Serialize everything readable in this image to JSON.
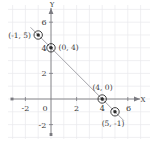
{
  "figure": {
    "title": "",
    "axis_labels": {
      "x": "X",
      "y": "Y"
    },
    "origin_label": "0",
    "colors": {
      "grid": "#e9e9ec",
      "axis": "#7a7a80",
      "line": "#9a9aa0",
      "marker": "#2b2b2b",
      "text": "#3a3a3a",
      "background": "#ffffff"
    },
    "x_ticks": [
      {
        "value": -2,
        "label": "-2"
      },
      {
        "value": 2,
        "label": "2"
      },
      {
        "value": 4,
        "label": "4"
      },
      {
        "value": 6,
        "label": "6"
      }
    ],
    "y_ticks": [
      {
        "value": -2,
        "label": "-2"
      },
      {
        "value": 2,
        "label": "2"
      },
      {
        "value": 4,
        "label": "4"
      },
      {
        "value": 6,
        "label": "6"
      }
    ],
    "points": [
      {
        "id": "p1",
        "x": -1,
        "y": 5,
        "label": "(-1, 5)",
        "label_side": "left"
      },
      {
        "id": "p2",
        "x": 0,
        "y": 4,
        "label": "(0, 4)",
        "label_side": "right"
      },
      {
        "id": "p3",
        "x": 4,
        "y": 0,
        "label": "(4, 0)",
        "label_side": "above"
      },
      {
        "id": "p4",
        "x": 5,
        "y": -1,
        "label": "(5, -1)",
        "label_side": "below"
      }
    ]
  },
  "chart_data": {
    "type": "scatter",
    "title": "",
    "xlabel": "X",
    "ylabel": "Y",
    "xlim": [
      -3,
      7
    ],
    "ylim": [
      -3,
      7
    ],
    "grid": true,
    "legend": "none",
    "series": [
      {
        "name": "line x + y = 4",
        "type": "line",
        "x": [
          -1.6,
          5.7
        ],
        "y": [
          5.6,
          -1.7
        ]
      },
      {
        "name": "plotted points",
        "type": "scatter",
        "points": [
          {
            "x": -1,
            "y": 5
          },
          {
            "x": 0,
            "y": 4
          },
          {
            "x": 4,
            "y": 0
          },
          {
            "x": 5,
            "y": -1
          }
        ],
        "labels": [
          "(-1, 5)",
          "(0, 4)",
          "(4, 0)",
          "(5, -1)"
        ]
      }
    ],
    "xticks": [
      -2,
      2,
      4,
      6
    ],
    "yticks": [
      -2,
      2,
      4,
      6
    ]
  }
}
